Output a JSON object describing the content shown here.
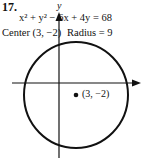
{
  "problem": {
    "number": "17.",
    "equation": "x² + y² − 6x + 4y = 68",
    "center_label": "Center (3, −2)",
    "radius_label": "Radius = 9"
  },
  "graph": {
    "y_axis_label": "y",
    "point_label": "(3, −2)",
    "circle": {
      "center": [
        3,
        -2
      ],
      "radius": 9
    },
    "line_color": "#111111"
  }
}
